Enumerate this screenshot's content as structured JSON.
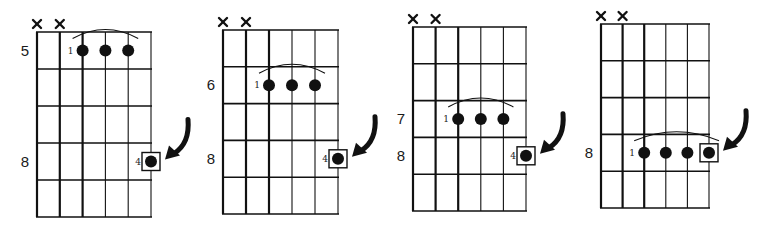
{
  "diagrams": [
    {
      "id": "diagram-1",
      "grid": {
        "left": 37,
        "right": 151,
        "top": 32,
        "bottom": 217,
        "strings": 6,
        "frets": 5
      },
      "muted_strings": [
        "x",
        "x"
      ],
      "fret_labels": [
        {
          "text": "5",
          "row": 0
        },
        {
          "text": "8",
          "row": 3
        }
      ],
      "barre": {
        "finger": "1",
        "row": 0,
        "from_string": 2,
        "to_string": 4
      },
      "highlight_note": {
        "finger": "4",
        "row": 3,
        "string": 5,
        "boxed": true
      },
      "arrow": true
    },
    {
      "id": "diagram-2",
      "grid": {
        "left": 223,
        "right": 338,
        "top": 30,
        "bottom": 214,
        "strings": 6,
        "frets": 5
      },
      "muted_strings": [
        "x",
        "x"
      ],
      "fret_labels": [
        {
          "text": "6",
          "row": 1
        },
        {
          "text": "8",
          "row": 3
        }
      ],
      "barre": {
        "finger": "1",
        "row": 1,
        "from_string": 2,
        "to_string": 4
      },
      "highlight_note": {
        "finger": "4",
        "row": 3,
        "string": 5,
        "boxed": true
      },
      "arrow": true
    },
    {
      "id": "diagram-3",
      "grid": {
        "left": 413,
        "right": 526,
        "top": 27,
        "bottom": 211,
        "strings": 6,
        "frets": 5
      },
      "muted_strings": [
        "x",
        "x"
      ],
      "fret_labels": [
        {
          "text": "7",
          "row": 2
        },
        {
          "text": "8",
          "row": 3
        }
      ],
      "barre": {
        "finger": "1",
        "row": 2,
        "from_string": 2,
        "to_string": 4
      },
      "highlight_note": {
        "finger": "4",
        "row": 3,
        "string": 5,
        "boxed": true
      },
      "arrow": true
    },
    {
      "id": "diagram-4",
      "grid": {
        "left": 601,
        "right": 709,
        "top": 24,
        "bottom": 208,
        "strings": 6,
        "frets": 5
      },
      "muted_strings": [
        "x",
        "x"
      ],
      "fret_labels": [
        {
          "text": "8",
          "row": 3
        }
      ],
      "barre": {
        "finger": "1",
        "row": 3,
        "from_string": 2,
        "to_string": 5
      },
      "highlight_note": {
        "finger": "",
        "row": 3,
        "string": 5,
        "boxed": true
      },
      "arrow": true
    }
  ],
  "colors": {
    "ink": "#111111",
    "background": "#ffffff"
  }
}
